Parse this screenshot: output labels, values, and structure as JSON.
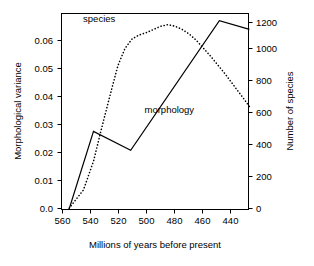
{
  "chart_data": {
    "type": "line",
    "title": "",
    "subtitle": "",
    "xlabel": "Millions of years before present",
    "ylabel": "Morphological variance",
    "y2label": "Number of species",
    "xlim": [
      565,
      435
    ],
    "x_reversed": true,
    "ylim": [
      0.0,
      0.068
    ],
    "y2lim": [
      0,
      1230
    ],
    "grid": false,
    "legend_position": "inline-annotations",
    "xticks": [
      560,
      540,
      520,
      500,
      480,
      460,
      440
    ],
    "xtick_labels": [
      "560",
      "540",
      "520",
      "500",
      "480",
      "460",
      "440"
    ],
    "yticks": [
      0.0,
      0.01,
      0.02,
      0.03,
      0.04,
      0.05,
      0.06
    ],
    "ytick_labels": [
      "0.0",
      "0.01",
      "0.02",
      "0.03",
      "0.04",
      "0.05",
      "0.06"
    ],
    "y2ticks": [
      0,
      200,
      400,
      600,
      800,
      1000,
      1200
    ],
    "y2tick_labels": [
      "0",
      "200",
      "400",
      "600",
      "800",
      "1000",
      "1200"
    ],
    "series": [
      {
        "name": "morphology",
        "axis": "left",
        "style": "solid",
        "color": "#000000",
        "annotation": "morphology",
        "annotation_x": 490,
        "annotation_y": 0.0335,
        "x": [
          560,
          543,
          517,
          455,
          434
        ],
        "values": [
          0.0,
          0.027,
          0.0204,
          0.0655,
          0.0625
        ]
      },
      {
        "name": "species",
        "axis": "right",
        "style": "dotted",
        "color": "#000000",
        "annotation": "species",
        "annotation_x": 539,
        "annotation_y": 1175,
        "x": [
          560,
          550,
          543,
          537,
          531,
          526,
          521,
          516,
          511,
          506,
          501,
          496,
          491,
          486,
          481,
          476,
          471,
          466,
          461,
          456,
          451,
          446,
          441,
          436,
          434
        ],
        "values": [
          5,
          120,
          300,
          520,
          730,
          900,
          1010,
          1070,
          1095,
          1110,
          1130,
          1150,
          1160,
          1150,
          1130,
          1100,
          1060,
          1010,
          960,
          905,
          850,
          790,
          730,
          670,
          645
        ]
      }
    ]
  },
  "axes": {
    "left_title": "Morphological variance",
    "right_title": "Number of species",
    "bottom_title": "Millions of years before present"
  },
  "annotations": {
    "species_label": "species",
    "morphology_label": "morphology"
  }
}
